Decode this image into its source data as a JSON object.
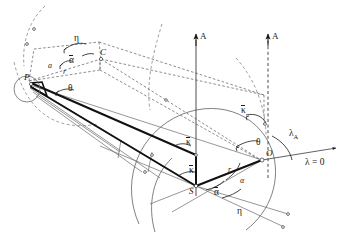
{
  "figure": {
    "background_color": "#ffffff",
    "line_color": "#2b2b2b",
    "thick_line_color": "#111111",
    "dashed_line_color": "#555555"
  },
  "points": {
    "P": "P",
    "C": "C",
    "S": "S",
    "O": "O"
  },
  "axes": {
    "A_solid": "A",
    "A_dashed": "A",
    "lambda_zero": "λ = 0"
  },
  "labels": {
    "eta_top": "η",
    "eta_bottom": "η",
    "alpha_bar_top": "α",
    "alpha_bar_bottom": "α",
    "alpha_left": "a",
    "alpha_right": "α",
    "r_top": "r",
    "r_bottom": "r",
    "theta_left": "θ",
    "theta_right": "θ",
    "kappa_bar_upper": "κ",
    "kappa_bar_mid": "κ",
    "kappa_bar_lower": "κ",
    "lambda_A": "λ",
    "lambda_A_sub": "A"
  }
}
